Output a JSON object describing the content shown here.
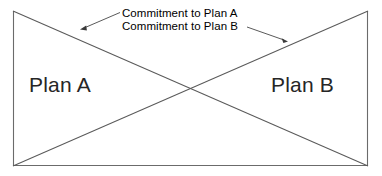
{
  "diagram": {
    "type": "x-crossing-commitment-diagram",
    "background_color": "#ffffff",
    "stroke_color": "#555555",
    "text_color": "#262626",
    "frame": {
      "left": 13,
      "top": 11,
      "right": 368,
      "bottom": 166,
      "borders_drawn": [
        "left",
        "right",
        "bottom"
      ],
      "top_border_drawn": false
    },
    "regions": {
      "left_label": "Plan A",
      "right_label": "Plan B"
    },
    "annotations": [
      {
        "text": "Commitment to Plan A",
        "points_to": "left-diagonal",
        "arrow_tip_x": 81,
        "arrow_tip_y": 29
      },
      {
        "text": "Commitment to Plan B",
        "points_to": "right-diagonal",
        "arrow_tip_x": 287,
        "arrow_tip_y": 41
      }
    ],
    "diagonals": [
      {
        "name": "plan-a-commitment-line",
        "from": [
          13,
          11
        ],
        "to": [
          368,
          166
        ]
      },
      {
        "name": "plan-b-commitment-line",
        "from": [
          368,
          11
        ],
        "to": [
          13,
          166
        ]
      }
    ],
    "crossing_point": [
      190,
      89
    ]
  }
}
